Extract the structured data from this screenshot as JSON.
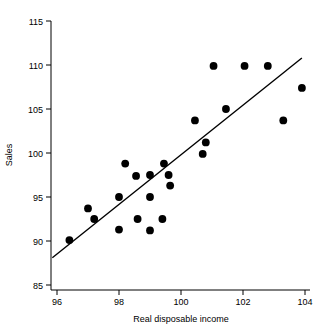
{
  "chart_data": {
    "type": "scatter",
    "title": "",
    "xlabel": "Real disposable income",
    "ylabel": "Sales",
    "xlim": [
      95.85,
      104.3
    ],
    "ylim": [
      85,
      115
    ],
    "xticks": [
      96,
      98,
      100,
      102,
      104
    ],
    "xtick_labels": [
      "96",
      "98",
      "100",
      "102",
      "104"
    ],
    "yticks": [
      85,
      90,
      95,
      100,
      105,
      110,
      115
    ],
    "ytick_labels": [
      "85",
      "90",
      "95",
      "100",
      "105",
      "110",
      "115"
    ],
    "grid": false,
    "legend": null,
    "marker": "filled-circle",
    "marker_color": "#000000",
    "marker_size": 5.2,
    "points": [
      {
        "x": 96.4,
        "y": 90.1
      },
      {
        "x": 97.0,
        "y": 93.7
      },
      {
        "x": 97.2,
        "y": 92.5
      },
      {
        "x": 98.0,
        "y": 95.0
      },
      {
        "x": 98.0,
        "y": 91.3
      },
      {
        "x": 98.2,
        "y": 98.8
      },
      {
        "x": 98.55,
        "y": 97.4
      },
      {
        "x": 98.6,
        "y": 92.5
      },
      {
        "x": 99.0,
        "y": 97.5
      },
      {
        "x": 99.0,
        "y": 95.0
      },
      {
        "x": 99.0,
        "y": 91.2
      },
      {
        "x": 99.4,
        "y": 92.5
      },
      {
        "x": 99.45,
        "y": 98.8
      },
      {
        "x": 99.6,
        "y": 97.5
      },
      {
        "x": 99.65,
        "y": 96.3
      },
      {
        "x": 100.45,
        "y": 103.7
      },
      {
        "x": 100.7,
        "y": 99.9
      },
      {
        "x": 100.8,
        "y": 101.2
      },
      {
        "x": 101.05,
        "y": 109.9
      },
      {
        "x": 101.45,
        "y": 105.0
      },
      {
        "x": 102.05,
        "y": 109.9
      },
      {
        "x": 102.8,
        "y": 109.9
      },
      {
        "x": 103.3,
        "y": 103.7
      },
      {
        "x": 103.9,
        "y": 107.4
      }
    ],
    "fit_line": {
      "type": "linear-regression",
      "x_start": 95.85,
      "y_start": 88.1,
      "x_end": 103.9,
      "y_end": 110.8
    }
  }
}
